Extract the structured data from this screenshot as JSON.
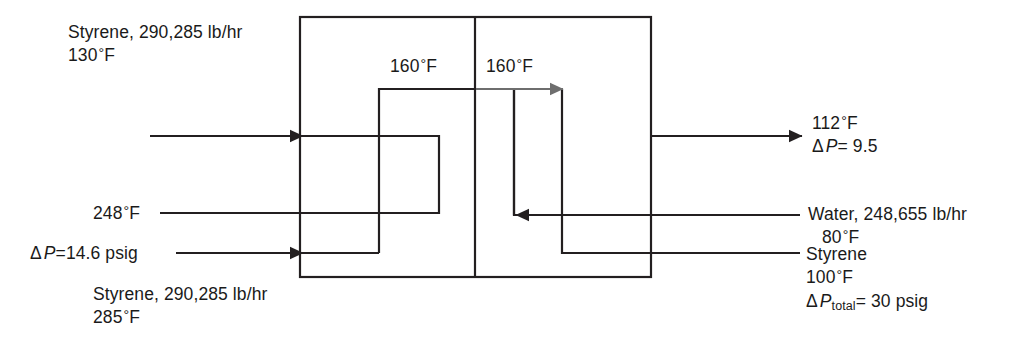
{
  "diagram": {
    "line_color": "#231f20",
    "gray_arrow_color": "#6e6e6e",
    "background": "#ffffff"
  },
  "labels": {
    "top_left": {
      "line1": "Styrene, 290,285 lb/hr",
      "line2_value": "130",
      "line2_unit": "F"
    },
    "inner_left": {
      "value": "160",
      "unit": "F"
    },
    "inner_right": {
      "value": "160",
      "unit": "F"
    },
    "mid_left": {
      "value": "248",
      "unit": "F"
    },
    "lower_left_dp": {
      "symbol": "Δ",
      "var": "P",
      "eq": "=14.6 psig"
    },
    "bottom_left": {
      "line1": "Styrene, 290,285 lb/hr",
      "line2_value": "285",
      "line2_unit": "F"
    },
    "top_right": {
      "line1_value": "112",
      "line1_unit": "F",
      "line2_symbol": "Δ",
      "line2_var": "P",
      "line2_eq": "= 9.5"
    },
    "water": {
      "line1": "Water,  248,655 lb/hr",
      "line2_value": "80",
      "line2_unit": "F"
    },
    "styrene_right": {
      "line1": "Styrene",
      "line2_value": "100",
      "line2_unit": "F",
      "line3_symbol": "Δ",
      "line3_var": "P",
      "line3_sub": "total",
      "line3_eq": "= 30 psig"
    }
  }
}
